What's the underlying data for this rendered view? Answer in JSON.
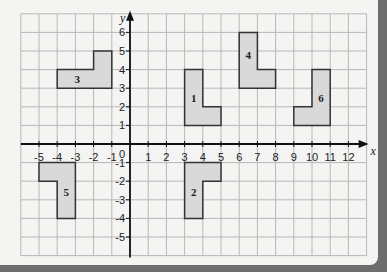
{
  "diagram": {
    "type": "coordinate-grid",
    "x_axis": {
      "label": "x",
      "min": -6,
      "max": 13,
      "ticks": [
        -5,
        -4,
        -3,
        -2,
        -1,
        1,
        2,
        3,
        4,
        5,
        6,
        7,
        8,
        9,
        10,
        11,
        12
      ]
    },
    "y_axis": {
      "label": "y",
      "min": -6,
      "max": 7,
      "ticks": [
        6,
        5,
        4,
        3,
        2,
        1,
        -1,
        -2,
        -3,
        -4,
        -5
      ]
    },
    "origin_label": "0",
    "colors": {
      "grid": "#b8b8b8",
      "axis": "#111111",
      "shape_fill": "#d9d9d9",
      "shape_stroke": "#333333",
      "background": "#f4f4f2",
      "frame": "#6e6e6e"
    },
    "shapes": [
      {
        "label": "1",
        "points": [
          [
            3,
            1
          ],
          [
            3,
            4
          ],
          [
            4,
            4
          ],
          [
            4,
            2
          ],
          [
            5,
            2
          ],
          [
            5,
            1
          ]
        ],
        "label_pos": [
          3.5,
          2.5
        ]
      },
      {
        "label": "2",
        "points": [
          [
            3,
            -4
          ],
          [
            3,
            -1
          ],
          [
            5,
            -1
          ],
          [
            5,
            -2
          ],
          [
            4,
            -2
          ],
          [
            4,
            -4
          ]
        ],
        "label_pos": [
          3.5,
          -2.6
        ]
      },
      {
        "label": "3",
        "points": [
          [
            -4,
            3
          ],
          [
            -4,
            4
          ],
          [
            -2,
            4
          ],
          [
            -2,
            5
          ],
          [
            -1,
            5
          ],
          [
            -1,
            3
          ]
        ],
        "label_pos": [
          -2.9,
          3.5
        ]
      },
      {
        "label": "4",
        "points": [
          [
            6,
            3
          ],
          [
            6,
            6
          ],
          [
            7,
            6
          ],
          [
            7,
            4
          ],
          [
            8,
            4
          ],
          [
            8,
            3
          ]
        ],
        "label_pos": [
          6.5,
          4.8
        ]
      },
      {
        "label": "5",
        "points": [
          [
            -5,
            -1
          ],
          [
            -5,
            -2
          ],
          [
            -4,
            -2
          ],
          [
            -4,
            -4
          ],
          [
            -3,
            -4
          ],
          [
            -3,
            -1
          ]
        ],
        "label_pos": [
          -3.5,
          -2.6
        ]
      },
      {
        "label": "6",
        "points": [
          [
            9,
            1
          ],
          [
            9,
            2
          ],
          [
            10,
            2
          ],
          [
            10,
            4
          ],
          [
            11,
            4
          ],
          [
            11,
            1
          ]
        ],
        "label_pos": [
          10.5,
          2.5
        ]
      }
    ]
  }
}
